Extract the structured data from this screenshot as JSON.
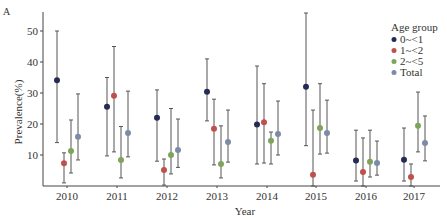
{
  "panel_label": "A",
  "chart_data": {
    "type": "scatter",
    "subtype": "point-with-error-bars",
    "title": "",
    "xlabel": "Year",
    "ylabel": "Prevalence(%)",
    "categories": [
      "2010",
      "2011",
      "2012",
      "2013",
      "2014",
      "2015",
      "2016",
      "2017"
    ],
    "ylim": [
      0,
      57
    ],
    "yticks": [
      10,
      20,
      30,
      40,
      50
    ],
    "grid": false,
    "legend": {
      "title": "Age group",
      "position": "top-right"
    },
    "series": [
      {
        "name": "0~<1",
        "color": "#262b55",
        "values": [
          34.1,
          25.6,
          22.0,
          30.4,
          19.8,
          32.0,
          8.2,
          8.5
        ],
        "upper": [
          50.0,
          35.0,
          31.0,
          41.0,
          38.7,
          55.8,
          18.0,
          18.7
        ],
        "lower": [
          14.0,
          9.7,
          8.0,
          21.0,
          7.1,
          13.0,
          1.6,
          1.6
        ]
      },
      {
        "name": "1~<2",
        "color": "#c0504d",
        "values": [
          7.3,
          29.1,
          5.2,
          18.5,
          20.6,
          3.6,
          4.5,
          2.9
        ],
        "upper": [
          10.7,
          45.0,
          8.7,
          28.0,
          33.0,
          24.5,
          15.5,
          7.1
        ],
        "lower": [
          1.0,
          11.0,
          0.3,
          6.8,
          7.4,
          0.0,
          0.0,
          0.0
        ]
      },
      {
        "name": "2~<5",
        "color": "#7ea45c",
        "values": [
          11.3,
          8.4,
          10.0,
          7.1,
          14.6,
          18.7,
          7.8,
          19.4
        ],
        "upper": [
          21.3,
          19.2,
          25.0,
          19.4,
          17.4,
          33.0,
          18.0,
          30.3
        ],
        "lower": [
          4.2,
          2.6,
          3.9,
          2.6,
          7.1,
          10.3,
          2.9,
          11.0
        ]
      },
      {
        "name": "Total",
        "color": "#7a8ca8",
        "values": [
          15.9,
          17.1,
          11.6,
          14.2,
          16.8,
          17.1,
          7.4,
          13.9
        ],
        "upper": [
          29.7,
          30.6,
          21.6,
          24.5,
          27.4,
          27.7,
          14.5,
          22.6
        ],
        "lower": [
          8.4,
          9.4,
          6.0,
          7.7,
          10.0,
          10.6,
          3.5,
          8.1
        ]
      }
    ]
  }
}
